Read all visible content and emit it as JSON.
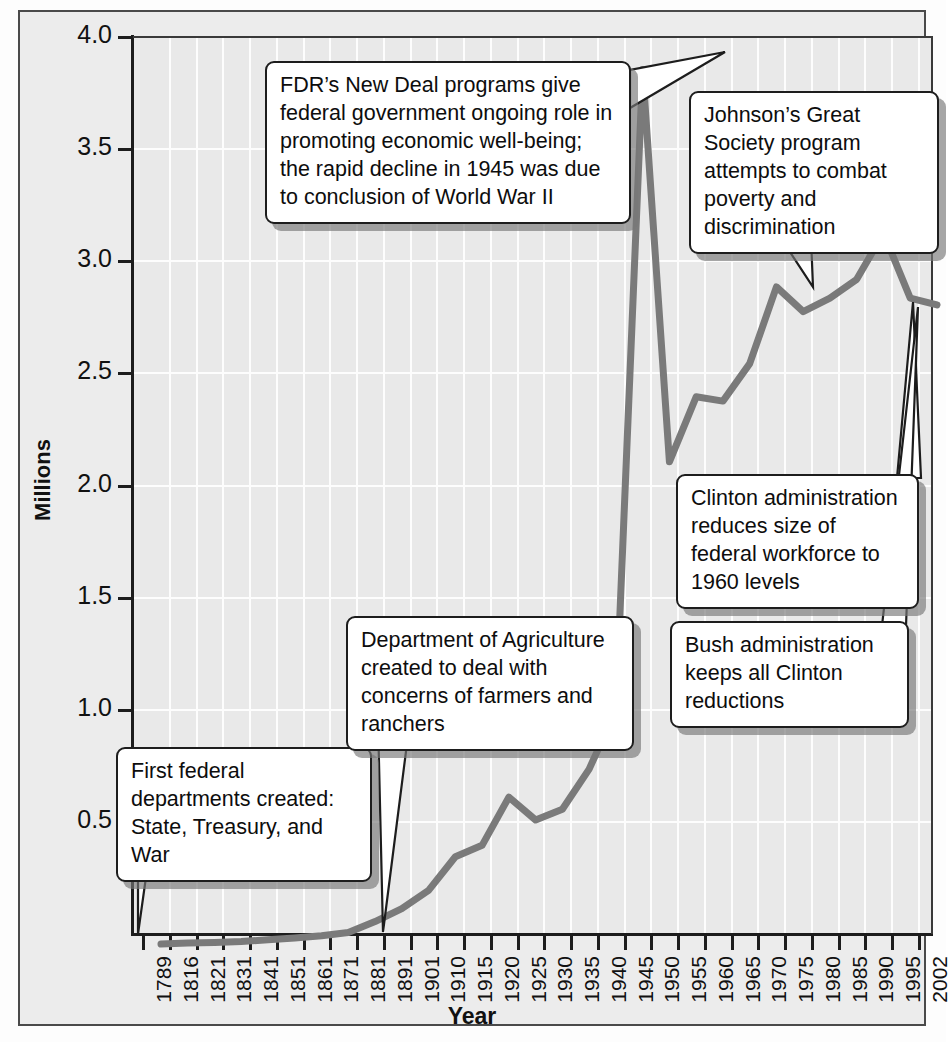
{
  "chart_data": {
    "type": "line",
    "title": "",
    "xlabel": "Year",
    "ylabel": "Millions",
    "ylim": [
      0,
      4.0
    ],
    "grid": true,
    "legend": "none",
    "yticks": [
      "0.5",
      "1.0",
      "1.5",
      "2.0",
      "2.5",
      "3.0",
      "3.5",
      "4.0"
    ],
    "ytick_values": [
      0.5,
      1.0,
      1.5,
      2.0,
      2.5,
      3.0,
      3.5,
      4.0
    ],
    "categories": [
      "1789",
      "1816",
      "1821",
      "1831",
      "1841",
      "1851",
      "1861",
      "1871",
      "1881",
      "1891",
      "1901",
      "1910",
      "1915",
      "1920",
      "1925",
      "1930",
      "1935",
      "1940",
      "1945",
      "1950",
      "1955",
      "1960",
      "1965",
      "1970",
      "1975",
      "1980",
      "1985",
      "1990",
      "1995",
      "2002"
    ],
    "values": [
      0.0,
      0.005,
      0.007,
      0.011,
      0.019,
      0.027,
      0.037,
      0.051,
      0.1,
      0.158,
      0.239,
      0.389,
      0.44,
      0.655,
      0.553,
      0.601,
      0.78,
      1.042,
      3.9,
      2.15,
      2.44,
      2.421,
      2.588,
      2.93,
      2.82,
      2.88,
      2.964,
      3.17,
      2.88,
      2.85
    ],
    "annotations": [
      {
        "id": "first-departments",
        "text": "First federal departments created: State, Treasury, and War",
        "points_to": "1789"
      },
      {
        "id": "dept-agriculture",
        "text": "Department of Agriculture created to deal with concerns of farmers and ranchers",
        "points_to": "1871"
      },
      {
        "id": "fdr-new-deal",
        "text": "FDR’s New Deal programs give federal government ongoing role in promoting economic well-being; the rapid decline in 1945 was due to conclusion of World War II",
        "points_to": "1945"
      },
      {
        "id": "johnson-great-society",
        "text": "Johnson’s Great Society program attempts to combat poverty and discrimination",
        "points_to": "1970"
      },
      {
        "id": "clinton-reductions",
        "text": "Clinton administration reduces size of federal workforce to 1960 levels",
        "points_to": "1995"
      },
      {
        "id": "bush-keeps-reductions",
        "text": "Bush administration keeps all Clinton reductions",
        "points_to": "2002"
      }
    ]
  },
  "annotations_text": {
    "first_departments": "First federal departments created: State, Treasury, and War",
    "dept_agriculture": "Department of Agriculture created to deal with concerns of farmers and ranchers",
    "fdr_new_deal": "FDR’s New Deal programs give federal government ongoing role in promoting economic well-being; the rapid decline in 1945 was due to conclusion of World War II",
    "johnson_great_society": "Johnson’s Great Society program attempts to combat poverty and discrimination",
    "clinton_reductions": "Clinton administration reduces size of federal workforce to 1960 levels",
    "bush_keeps_reductions": "Bush administration keeps all Clinton reductions"
  },
  "colors": {
    "line": "#7a7a7a",
    "plot_background": "#e9e9e9",
    "figure_background": "#ececec",
    "grid": "#fdfdfd",
    "axis": "#1d1d1d",
    "callout_border": "#1d1d1d",
    "callout_fill": "#ffffff"
  }
}
